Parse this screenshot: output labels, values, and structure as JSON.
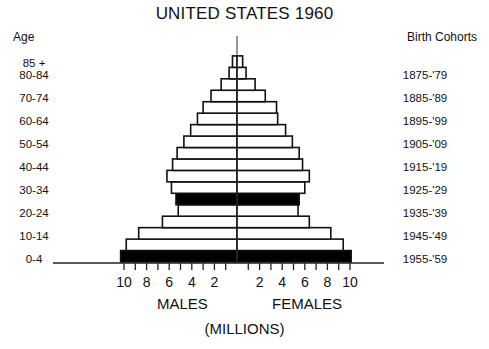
{
  "chart_data": {
    "type": "bar",
    "subtype": "population-pyramid",
    "title": "UNITED STATES 1960",
    "left_axis_title": "Age",
    "right_axis_title": "Birth Cohorts",
    "xlabel": "(MILLIONS)",
    "side_labels": [
      "MALES",
      "FEMALES"
    ],
    "x_ticks_left": [
      "10",
      "8",
      "6",
      "4",
      "2"
    ],
    "x_ticks_right": [
      "2",
      "4",
      "6",
      "8",
      "10"
    ],
    "xlim": [
      -10,
      10
    ],
    "categories": [
      "0-4",
      "5-9",
      "10-14",
      "15-19",
      "20-24",
      "25-29",
      "30-34",
      "35-39",
      "40-44",
      "45-49",
      "50-54",
      "55-59",
      "60-64",
      "65-69",
      "70-74",
      "75-79",
      "80-84",
      "85+"
    ],
    "age_labels_shown": [
      "85 +",
      "80-84",
      "70-74",
      "60-64",
      "50-54",
      "40-44",
      "30-34",
      "20-24",
      "10-14",
      "0-4"
    ],
    "cohort_labels_shown": [
      "1875-'79",
      "1885-'89",
      "1895-'99",
      "1905-'09",
      "1915-'19",
      "1925-'29",
      "1935-'39",
      "1945-'49",
      "1955-'59"
    ],
    "series": [
      {
        "name": "MALES",
        "values": [
          10.3,
          9.8,
          8.7,
          6.6,
          5.2,
          5.4,
          5.8,
          6.2,
          5.7,
          5.3,
          4.7,
          4.1,
          3.5,
          3.0,
          2.3,
          1.4,
          0.7,
          0.4
        ]
      },
      {
        "name": "FEMALES",
        "values": [
          10.1,
          9.4,
          8.3,
          6.4,
          5.4,
          5.5,
          6.0,
          6.4,
          5.8,
          5.5,
          4.9,
          4.3,
          3.6,
          3.5,
          2.5,
          1.6,
          0.8,
          0.5
        ]
      }
    ],
    "highlighted_categories": [
      "0-4",
      "25-29"
    ],
    "highlight_color": "#000000",
    "bar_fill": "#ffffff",
    "bar_stroke": "#111111",
    "grid": false
  },
  "footnote": "Source: U.S. Bureau of the Census, 1960"
}
